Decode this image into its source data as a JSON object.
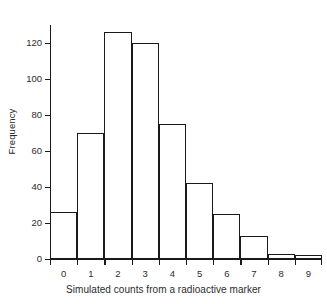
{
  "chart_data": {
    "type": "bar",
    "title": "",
    "xlabel": "Simulated counts from a radioactive marker",
    "ylabel": "Frequency",
    "categories": [
      "0",
      "1",
      "2",
      "3",
      "4",
      "5",
      "6",
      "7",
      "8",
      "9"
    ],
    "values": [
      26,
      70,
      126,
      120,
      75,
      42,
      25,
      13,
      3,
      2
    ],
    "ylim": [
      0,
      130
    ],
    "yticks": [
      0,
      20,
      40,
      60,
      80,
      100,
      120
    ],
    "ytick_labels": [
      "0",
      "20",
      "40",
      "60",
      "80",
      "100",
      "120"
    ],
    "xlim": [
      -0.5,
      9.5
    ],
    "grid": false,
    "legend": null,
    "bar_edge_color": "#1a1a1a",
    "bar_fill_color": "#ffffff",
    "axis_color": "#1a1a1a"
  }
}
